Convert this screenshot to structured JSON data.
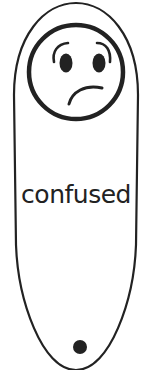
{
  "card": {
    "label": "confused",
    "face_icon": "confused-face-icon",
    "colors": {
      "stroke": "#222222",
      "background": "#ffffff"
    }
  }
}
